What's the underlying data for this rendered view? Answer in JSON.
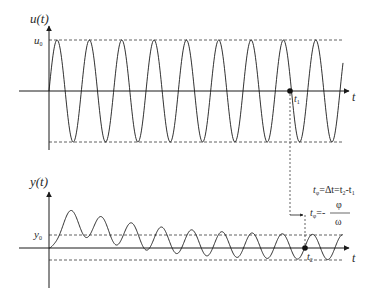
{
  "top_plot": {
    "y_axis_label": "u(t)",
    "amplitude_label_main": "u",
    "amplitude_label_sub": "0",
    "x_axis_label": "t",
    "marker_label_main": "t",
    "marker_label_sub": "1",
    "periods": 9,
    "description": "Input sinusoid of constant amplitude u0"
  },
  "bottom_plot": {
    "y_axis_label": "y(t)",
    "amplitude_label_main": "y",
    "amplitude_label_sub": "0",
    "x_axis_label": "t",
    "marker_label_main": "t",
    "marker_label_sub": "2",
    "description": "Output response: transient oscillation settling to steady-state sinusoid of amplitude y0"
  },
  "equations": {
    "line1_lhs_main": "t",
    "line1_lhs_sub": "φ",
    "line1_rest": "=Δt=t",
    "line1_t2_sub": "2",
    "line1_minus": "-t",
    "line1_t1_sub": "1",
    "line2_lhs_main": "t",
    "line2_lhs_sub": "φ",
    "line2_eq": "=-",
    "line2_numerator": "φ",
    "line2_denominator": "ω"
  },
  "colors": {
    "stroke": "#2a2a2a",
    "dashed": "#3a3a3a",
    "background": "#ffffff"
  }
}
